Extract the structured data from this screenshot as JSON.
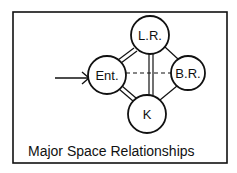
{
  "diagram": {
    "caption": "Major Space Relationships",
    "nodes": [
      {
        "id": "lr",
        "label": "L.R.",
        "cx": 150,
        "cy": 35,
        "r": 19
      },
      {
        "id": "ent",
        "label": "Ent.",
        "cx": 107,
        "cy": 75,
        "r": 19
      },
      {
        "id": "br",
        "label": "B.R.",
        "cx": 188,
        "cy": 73,
        "r": 17
      },
      {
        "id": "k",
        "label": "K",
        "cx": 147,
        "cy": 114,
        "r": 19
      }
    ],
    "edges": [
      {
        "from": "ent",
        "to": "lr",
        "style": "double"
      },
      {
        "from": "ent",
        "to": "k",
        "style": "double"
      },
      {
        "from": "lr",
        "to": "k",
        "style": "double"
      },
      {
        "from": "ent",
        "to": "br",
        "style": "dashed"
      },
      {
        "from": "lr",
        "to": "br",
        "style": "single"
      },
      {
        "from": "k",
        "to": "br",
        "style": "single"
      }
    ],
    "entry_arrow": {
      "target": "ent"
    },
    "colors": {
      "ink": "#111111",
      "background": "#ffffff"
    }
  }
}
